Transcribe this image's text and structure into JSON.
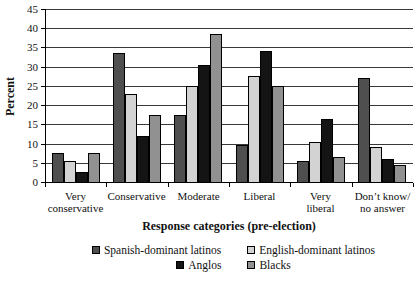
{
  "chart_data": {
    "type": "bar",
    "title": "",
    "xlabel": "Response categories (pre-election)",
    "ylabel": "Percent",
    "ylim": [
      0,
      45
    ],
    "ytick_step": 5,
    "grid": "horizontal",
    "legend_position": "bottom",
    "categories": [
      "Very\nconservative",
      "Conservative",
      "Moderate",
      "Liberal",
      "Very\nliberal",
      "Don’t know/\nno answer"
    ],
    "series": [
      {
        "name": "Spanish-dominant latinos",
        "color": "#4f4f4f",
        "values": [
          7.5,
          33.5,
          17.5,
          9.5,
          5.5,
          27
        ]
      },
      {
        "name": "English-dominant latinos",
        "color": "#d3d3d3",
        "values": [
          5.5,
          23,
          25,
          27.5,
          10.5,
          9
        ]
      },
      {
        "name": "Anglos",
        "color": "#141414",
        "values": [
          2.5,
          12,
          30.5,
          34,
          16.5,
          6
        ]
      },
      {
        "name": "Blacks",
        "color": "#919191",
        "values": [
          7.5,
          17.5,
          38.5,
          25,
          6.5,
          4.5
        ]
      }
    ],
    "legend_rows": [
      [
        0,
        1
      ],
      [
        2,
        3
      ]
    ],
    "colors": {
      "axis": "#000000",
      "gridline": "#383838",
      "bar_border": "#000000",
      "background": "#ffffff",
      "text": "#111111"
    }
  }
}
